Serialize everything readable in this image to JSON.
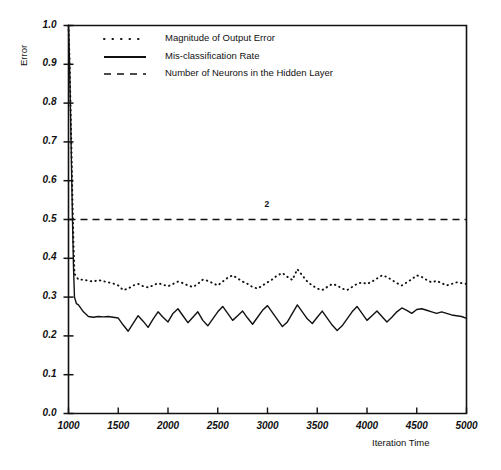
{
  "chart_data": {
    "type": "line",
    "title": "",
    "xlabel": "Iteration Time",
    "ylabel": "Error",
    "xlim": [
      1000,
      5000
    ],
    "ylim": [
      0.0,
      1.0
    ],
    "xticks": [
      1000,
      1500,
      2000,
      2500,
      3000,
      3500,
      4000,
      4500,
      5000
    ],
    "xtick_labels": [
      "1000",
      "1500",
      "2000",
      "2500",
      "3000",
      "3500",
      "4000",
      "4500",
      "5000"
    ],
    "yticks": [
      0.0,
      0.1,
      0.2,
      0.3,
      0.4,
      0.5,
      0.6,
      0.7,
      0.8,
      0.9,
      1.0
    ],
    "ytick_labels": [
      "0.0",
      "0.1",
      "0.2",
      "0.3",
      "0.4",
      "0.5",
      "0.6",
      "0.7",
      "0.8",
      "0.9",
      "1.0"
    ],
    "grid": false,
    "legend_position": "top-center-inside",
    "annotations": [
      {
        "text": "2",
        "x": 3000,
        "y": 0.525
      }
    ],
    "series": [
      {
        "name": "Magnitude of Output Error",
        "style": "dotted",
        "color": "#111111",
        "x": [
          1000,
          1010,
          1020,
          1030,
          1040,
          1050,
          1060,
          1100,
          1150,
          1200,
          1250,
          1300,
          1350,
          1400,
          1450,
          1500,
          1550,
          1600,
          1650,
          1700,
          1750,
          1800,
          1850,
          1900,
          1950,
          2000,
          2050,
          2100,
          2150,
          2200,
          2250,
          2300,
          2350,
          2400,
          2450,
          2500,
          2550,
          2600,
          2650,
          2700,
          2750,
          2800,
          2850,
          2900,
          2950,
          3000,
          3050,
          3100,
          3150,
          3200,
          3250,
          3300,
          3350,
          3400,
          3450,
          3500,
          3550,
          3600,
          3650,
          3700,
          3750,
          3800,
          3850,
          3900,
          3950,
          4000,
          4050,
          4100,
          4150,
          4200,
          4250,
          4300,
          4350,
          4400,
          4450,
          4500,
          4550,
          4600,
          4650,
          4700,
          4750,
          4800,
          4850,
          4900,
          4950,
          5000
        ],
        "y": [
          1.0,
          0.92,
          0.8,
          0.68,
          0.55,
          0.44,
          0.36,
          0.345,
          0.345,
          0.342,
          0.34,
          0.344,
          0.341,
          0.338,
          0.335,
          0.33,
          0.318,
          0.322,
          0.33,
          0.334,
          0.328,
          0.325,
          0.33,
          0.336,
          0.332,
          0.328,
          0.334,
          0.34,
          0.336,
          0.33,
          0.326,
          0.334,
          0.345,
          0.342,
          0.336,
          0.33,
          0.34,
          0.35,
          0.356,
          0.348,
          0.34,
          0.334,
          0.326,
          0.322,
          0.33,
          0.338,
          0.346,
          0.356,
          0.362,
          0.352,
          0.344,
          0.372,
          0.356,
          0.34,
          0.33,
          0.322,
          0.318,
          0.326,
          0.334,
          0.33,
          0.322,
          0.318,
          0.326,
          0.334,
          0.338,
          0.334,
          0.34,
          0.348,
          0.356,
          0.352,
          0.344,
          0.336,
          0.33,
          0.338,
          0.346,
          0.356,
          0.352,
          0.344,
          0.338,
          0.342,
          0.336,
          0.33,
          0.334,
          0.338,
          0.336,
          0.334
        ]
      },
      {
        "name": "Mis-classification Rate",
        "style": "solid",
        "color": "#111111",
        "x": [
          1000,
          1010,
          1020,
          1030,
          1040,
          1050,
          1060,
          1080,
          1100,
          1150,
          1200,
          1250,
          1300,
          1350,
          1400,
          1450,
          1500,
          1550,
          1600,
          1650,
          1700,
          1750,
          1800,
          1850,
          1900,
          1950,
          2000,
          2050,
          2100,
          2150,
          2200,
          2250,
          2300,
          2350,
          2400,
          2450,
          2500,
          2550,
          2600,
          2650,
          2700,
          2750,
          2800,
          2850,
          2900,
          2950,
          3000,
          3050,
          3100,
          3150,
          3200,
          3250,
          3300,
          3350,
          3400,
          3450,
          3500,
          3550,
          3600,
          3650,
          3700,
          3750,
          3800,
          3850,
          3900,
          3950,
          4000,
          4050,
          4100,
          4150,
          4200,
          4250,
          4300,
          4350,
          4400,
          4450,
          4500,
          4550,
          4600,
          4650,
          4700,
          4750,
          4800,
          4850,
          4900,
          4950,
          5000
        ],
        "y": [
          1.0,
          0.91,
          0.78,
          0.64,
          0.5,
          0.38,
          0.3,
          0.283,
          0.28,
          0.262,
          0.25,
          0.248,
          0.25,
          0.249,
          0.25,
          0.248,
          0.246,
          0.228,
          0.212,
          0.232,
          0.252,
          0.238,
          0.222,
          0.243,
          0.262,
          0.248,
          0.236,
          0.258,
          0.27,
          0.252,
          0.234,
          0.248,
          0.262,
          0.24,
          0.226,
          0.244,
          0.262,
          0.276,
          0.258,
          0.24,
          0.252,
          0.264,
          0.246,
          0.23,
          0.248,
          0.266,
          0.278,
          0.26,
          0.242,
          0.224,
          0.236,
          0.258,
          0.28,
          0.262,
          0.244,
          0.232,
          0.248,
          0.264,
          0.246,
          0.228,
          0.214,
          0.226,
          0.244,
          0.262,
          0.276,
          0.258,
          0.24,
          0.252,
          0.264,
          0.25,
          0.236,
          0.248,
          0.262,
          0.272,
          0.266,
          0.258,
          0.268,
          0.27,
          0.266,
          0.262,
          0.258,
          0.262,
          0.258,
          0.254,
          0.252,
          0.25,
          0.245
        ]
      },
      {
        "name": "Number of Neurons in the Hidden Layer",
        "style": "dashed",
        "color": "#111111",
        "x": [
          1000,
          5000
        ],
        "y": [
          0.5,
          0.5
        ]
      }
    ]
  },
  "legend": {
    "items": [
      {
        "label": "Magnitude of Output Error",
        "style": "dotted"
      },
      {
        "label": "Mis-classification Rate",
        "style": "solid"
      },
      {
        "label": "Number of Neurons in the Hidden Layer",
        "style": "dashed"
      }
    ]
  },
  "axes": {
    "y_title": "Error",
    "x_title": "Iteration Time"
  },
  "colors": {
    "ink": "#111111",
    "background": "#ffffff"
  }
}
